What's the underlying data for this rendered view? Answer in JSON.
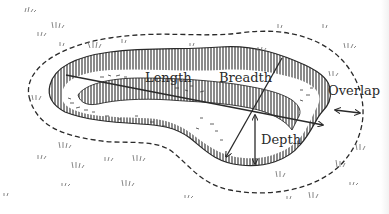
{
  "diagram": {
    "labels": {
      "length": "Length",
      "breadth": "Breadth",
      "overlap": "Overlap",
      "depth": "Depth"
    },
    "colors": {
      "ink": "#2a2a2a",
      "background": "#ffffff",
      "grass": "#6a6a6a"
    }
  }
}
